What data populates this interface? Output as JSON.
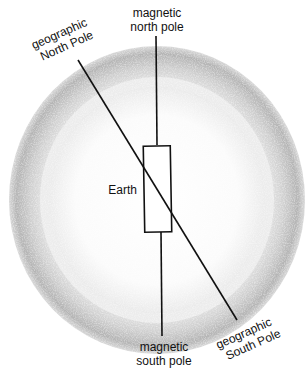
{
  "labels": {
    "magnetic_north_line1": "magnetic",
    "magnetic_north_line2": "north pole",
    "geographic_north_line1": "geographic",
    "geographic_north_line2": "North Pole",
    "earth": "Earth",
    "magnetic_south_line1": "magnetic",
    "magnetic_south_line2": "south pole",
    "geographic_south_line1": "geographic",
    "geographic_south_line2": "South Pole"
  },
  "colors": {
    "ink": "#111111",
    "globe_shade": "#9a9a9a"
  }
}
